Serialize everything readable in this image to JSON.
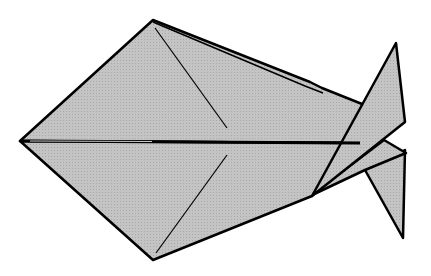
{
  "diagram": {
    "type": "origami-fold-diagram",
    "subject": "origami fish",
    "colors": {
      "paper_fill": "#bdbdbd",
      "outline": "#000000",
      "background": "#ffffff"
    },
    "parts": [
      {
        "name": "body-upper-half",
        "description": "upper kite half of fish body"
      },
      {
        "name": "body-lower-half",
        "description": "lower kite half of fish body"
      },
      {
        "name": "tail-upper-fin",
        "description": "upper tail fin pointing up-right"
      },
      {
        "name": "tail-lower-fin",
        "description": "lower tail fin pointing down-right"
      },
      {
        "name": "center-crease",
        "description": "horizontal center fold line"
      },
      {
        "name": "upper-crease",
        "description": "diagonal crease in upper half"
      },
      {
        "name": "lower-crease",
        "description": "diagonal crease in lower half"
      }
    ]
  }
}
